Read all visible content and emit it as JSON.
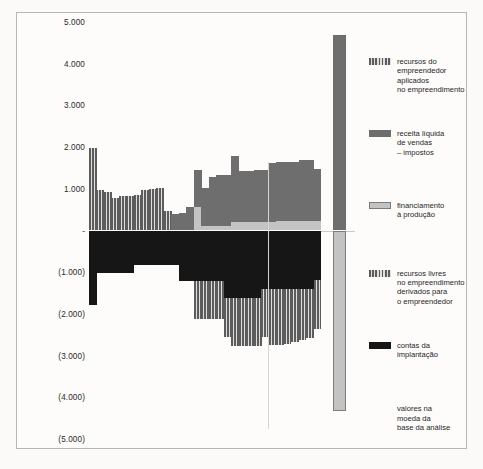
{
  "chart_data": {
    "type": "bar",
    "title": "",
    "subtitle": "",
    "xlabel": "",
    "ylabel": "",
    "ylim": [
      -5000,
      5000
    ],
    "grid": false,
    "legend_position": "right",
    "yticks": [
      {
        "value": 5000,
        "label": "5.000"
      },
      {
        "value": 4000,
        "label": "4.000"
      },
      {
        "value": 3000,
        "label": "3.000"
      },
      {
        "value": 2000,
        "label": "2.000"
      },
      {
        "value": 1000,
        "label": "1.000"
      },
      {
        "value": 0,
        "label": "-"
      },
      {
        "value": -1000,
        "label": "(1.000)"
      },
      {
        "value": -2000,
        "label": "(2.000)"
      },
      {
        "value": -3000,
        "label": "(3.000)"
      },
      {
        "value": -4000,
        "label": "(4.000)"
      },
      {
        "value": -5000,
        "label": "(5.000)"
      }
    ],
    "series": [
      {
        "name": "recursos do empreendedor aplicados no empreendimento",
        "key": "recursos_empreendedor",
        "fill": "stripe",
        "color": "#5c5c5c",
        "sign": "positive"
      },
      {
        "name": "receita líquida de vendas – impostos",
        "key": "receita_liquida",
        "fill": "solid",
        "color": "#6e6e6e",
        "sign": "positive"
      },
      {
        "name": "financiamento à produção",
        "key": "financiamento",
        "fill": "light",
        "color": "#c3c3c3",
        "sign": "positive"
      },
      {
        "name": "recursos livres no empreendimento derivados para o empreendedor",
        "key": "recursos_livres",
        "fill": "stripe",
        "color": "#5c5c5c",
        "sign": "negative"
      },
      {
        "name": "contas da implantação",
        "key": "contas_implantacao",
        "fill": "black",
        "color": "#161616",
        "sign": "negative"
      }
    ],
    "periods": [
      {
        "i": 1,
        "recursos_empreendedor": 1990,
        "receita_liquida": 0,
        "financiamento": 0,
        "contas_implantacao": -1790,
        "recursos_livres": 0
      },
      {
        "i": 2,
        "recursos_empreendedor": 980,
        "receita_liquida": 0,
        "financiamento": 0,
        "contas_implantacao": -1010,
        "recursos_livres": 0
      },
      {
        "i": 3,
        "recursos_empreendedor": 930,
        "receita_liquida": 0,
        "financiamento": 0,
        "contas_implantacao": -1010,
        "recursos_livres": 0
      },
      {
        "i": 4,
        "recursos_empreendedor": 790,
        "receita_liquida": 0,
        "financiamento": 0,
        "contas_implantacao": -1010,
        "recursos_livres": 0
      },
      {
        "i": 5,
        "recursos_empreendedor": 830,
        "receita_liquida": 0,
        "financiamento": 0,
        "contas_implantacao": -1010,
        "recursos_livres": 0
      },
      {
        "i": 6,
        "recursos_empreendedor": 830,
        "receita_liquida": 0,
        "financiamento": 0,
        "contas_implantacao": -1010,
        "recursos_livres": 0
      },
      {
        "i": 7,
        "recursos_empreendedor": 840,
        "receita_liquida": 0,
        "financiamento": 0,
        "contas_implantacao": -830,
        "recursos_livres": 0
      },
      {
        "i": 8,
        "recursos_empreendedor": 980,
        "receita_liquida": 0,
        "financiamento": 0,
        "contas_implantacao": -830,
        "recursos_livres": 0
      },
      {
        "i": 9,
        "recursos_empreendedor": 1000,
        "receita_liquida": 0,
        "financiamento": 0,
        "contas_implantacao": -830,
        "recursos_livres": 0
      },
      {
        "i": 10,
        "recursos_empreendedor": 1010,
        "receita_liquida": 0,
        "financiamento": 0,
        "contas_implantacao": -830,
        "recursos_livres": 0
      },
      {
        "i": 11,
        "recursos_empreendedor": 460,
        "receita_liquida": 0,
        "financiamento": 0,
        "contas_implantacao": -830,
        "recursos_livres": 0
      },
      {
        "i": 12,
        "recursos_empreendedor": 0,
        "receita_liquida": 390,
        "financiamento": 0,
        "contas_implantacao": -830,
        "recursos_livres": 0
      },
      {
        "i": 13,
        "recursos_empreendedor": 0,
        "receita_liquida": 420,
        "financiamento": 0,
        "contas_implantacao": -1200,
        "recursos_livres": 0
      },
      {
        "i": 14,
        "recursos_empreendedor": 0,
        "receita_liquida": 560,
        "financiamento": 0,
        "contas_implantacao": -1200,
        "recursos_livres": 0
      },
      {
        "i": 15,
        "recursos_empreendedor": 0,
        "receita_liquida": 880,
        "financiamento": 560,
        "contas_implantacao": -1200,
        "recursos_livres": -930
      },
      {
        "i": 16,
        "recursos_empreendedor": 0,
        "receita_liquida": 900,
        "financiamento": 110,
        "contas_implantacao": -1200,
        "recursos_livres": -930
      },
      {
        "i": 17,
        "recursos_empreendedor": 0,
        "receita_liquida": 1180,
        "financiamento": 110,
        "contas_implantacao": -1200,
        "recursos_livres": -930
      },
      {
        "i": 18,
        "recursos_empreendedor": 0,
        "receita_liquida": 1210,
        "financiamento": 110,
        "contas_implantacao": -1200,
        "recursos_livres": -930
      },
      {
        "i": 19,
        "recursos_empreendedor": 0,
        "receita_liquida": 1230,
        "financiamento": 110,
        "contas_implantacao": -1630,
        "recursos_livres": -930
      },
      {
        "i": 20,
        "recursos_empreendedor": 0,
        "receita_liquida": 1590,
        "financiamento": 200,
        "contas_implantacao": -1630,
        "recursos_livres": -1150
      },
      {
        "i": 21,
        "recursos_empreendedor": 0,
        "receita_liquida": 1230,
        "financiamento": 200,
        "contas_implantacao": -1630,
        "recursos_livres": -1150
      },
      {
        "i": 22,
        "recursos_empreendedor": 0,
        "receita_liquida": 1230,
        "financiamento": 200,
        "contas_implantacao": -1630,
        "recursos_livres": -1150
      },
      {
        "i": 23,
        "recursos_empreendedor": 0,
        "receita_liquida": 1260,
        "financiamento": 200,
        "contas_implantacao": -1630,
        "recursos_livres": -1150
      },
      {
        "i": 24,
        "recursos_empreendedor": 0,
        "receita_liquida": 1260,
        "financiamento": 200,
        "contas_implantacao": -1400,
        "recursos_livres": -1150
      },
      {
        "i": 25,
        "recursos_empreendedor": 0,
        "receita_liquida": 1410,
        "financiamento": 200,
        "contas_implantacao": -1400,
        "recursos_livres": -1350
      },
      {
        "i": 26,
        "recursos_empreendedor": 0,
        "receita_liquida": 1410,
        "financiamento": 230,
        "contas_implantacao": -1400,
        "recursos_livres": -1350
      },
      {
        "i": 27,
        "recursos_empreendedor": 0,
        "receita_liquida": 1420,
        "financiamento": 230,
        "contas_implantacao": -1400,
        "recursos_livres": -1310
      },
      {
        "i": 28,
        "recursos_empreendedor": 0,
        "receita_liquida": 1420,
        "financiamento": 230,
        "contas_implantacao": -1400,
        "recursos_livres": -1270
      },
      {
        "i": 29,
        "recursos_empreendedor": 0,
        "receita_liquida": 1450,
        "financiamento": 230,
        "contas_implantacao": -1400,
        "recursos_livres": -1230
      },
      {
        "i": 30,
        "recursos_empreendedor": 0,
        "receita_liquida": 1450,
        "financiamento": 230,
        "contas_implantacao": -1400,
        "recursos_livres": -1180
      },
      {
        "i": 31,
        "recursos_empreendedor": 0,
        "receita_liquida": 1240,
        "financiamento": 230,
        "contas_implantacao": -1180,
        "recursos_livres": -1180
      }
    ],
    "total_bar": {
      "label": "total",
      "positive_value": 4690,
      "negative_value": -4340,
      "positive_fill": "solid",
      "negative_fill": "light"
    }
  },
  "legend": {
    "items": [
      {
        "label": "recursos do\nempreendedor\naplicados\nno empreendimento",
        "swatch": "stripe",
        "y_pct": 10.0
      },
      {
        "label": "receita líquida\nde vendas\n– impostos",
        "swatch": "solid",
        "y_pct": 26.5
      },
      {
        "label": "financiamento\nà produção",
        "swatch": "light",
        "y_pct": 43.0
      },
      {
        "label": "recursos livres\nno empreendimento\nderivados para\no empreendedor",
        "swatch": "stripe",
        "y_pct": 58.5
      },
      {
        "label": "contas da\nimplantação",
        "swatch": "black",
        "y_pct": 75.0
      }
    ],
    "note": "valores na\nmoeda da\nbase da análise",
    "note_y_pct": 89.5
  }
}
